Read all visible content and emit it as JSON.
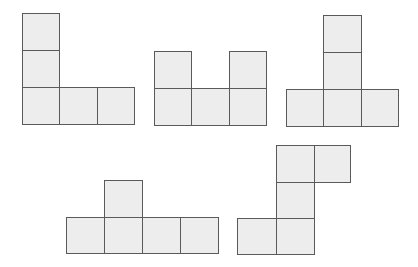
{
  "diagram": {
    "title": "",
    "colors": {
      "fill": "#ededed",
      "stroke": "#5a5a5a",
      "background": "#ffffff"
    },
    "shapes": [
      {
        "name": "net-1-L",
        "cells": [
          [
            22,
            13,
            38,
            38
          ],
          [
            22,
            50,
            38,
            38
          ],
          [
            22,
            87,
            38,
            38
          ],
          [
            59,
            87,
            39,
            38
          ],
          [
            97,
            87,
            38,
            38
          ]
        ]
      },
      {
        "name": "net-2-U",
        "cells": [
          [
            154,
            51,
            38,
            38
          ],
          [
            229,
            51,
            38,
            38
          ],
          [
            154,
            88,
            38,
            38
          ],
          [
            191,
            88,
            39,
            38
          ],
          [
            229,
            88,
            38,
            38
          ]
        ]
      },
      {
        "name": "net-3-T",
        "cells": [
          [
            323,
            15,
            39,
            38
          ],
          [
            323,
            52,
            39,
            38
          ],
          [
            286,
            89,
            38,
            38
          ],
          [
            323,
            89,
            39,
            38
          ],
          [
            361,
            89,
            38,
            38
          ]
        ]
      },
      {
        "name": "net-4",
        "cells": [
          [
            104,
            180,
            39,
            38
          ],
          [
            66,
            217,
            39,
            37
          ],
          [
            104,
            217,
            39,
            37
          ],
          [
            142,
            217,
            39,
            37
          ],
          [
            180,
            217,
            39,
            37
          ]
        ]
      },
      {
        "name": "net-5",
        "cells": [
          [
            276,
            145,
            39,
            38
          ],
          [
            314,
            145,
            37,
            38
          ],
          [
            276,
            182,
            39,
            37
          ],
          [
            237,
            218,
            40,
            37
          ],
          [
            276,
            218,
            39,
            37
          ]
        ]
      }
    ]
  }
}
